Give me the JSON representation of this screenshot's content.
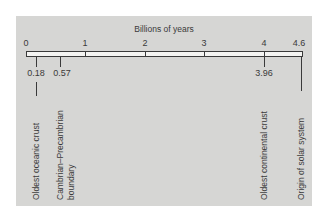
{
  "diagram": {
    "title": "Billions of years",
    "axis_ticks": [
      {
        "label": "0",
        "value": 0
      },
      {
        "label": "1",
        "value": 1
      },
      {
        "label": "2",
        "value": 2
      },
      {
        "label": "3",
        "value": 3
      },
      {
        "label": "4",
        "value": 4
      },
      {
        "label": "4.6",
        "value": 4.6
      }
    ],
    "events": [
      {
        "value_label": "0.18",
        "value": 0.18,
        "label": "Oldest oceanic crust"
      },
      {
        "value_label": "0.57",
        "value": 0.57,
        "label_line1": "Cambrian–Precambrian",
        "label_line2": "boundary"
      },
      {
        "value_label": "3.96",
        "value": 3.96,
        "label": "Oldest continental crust"
      },
      {
        "value_label": "",
        "value": 4.6,
        "label": "Origin of solar system"
      }
    ]
  }
}
